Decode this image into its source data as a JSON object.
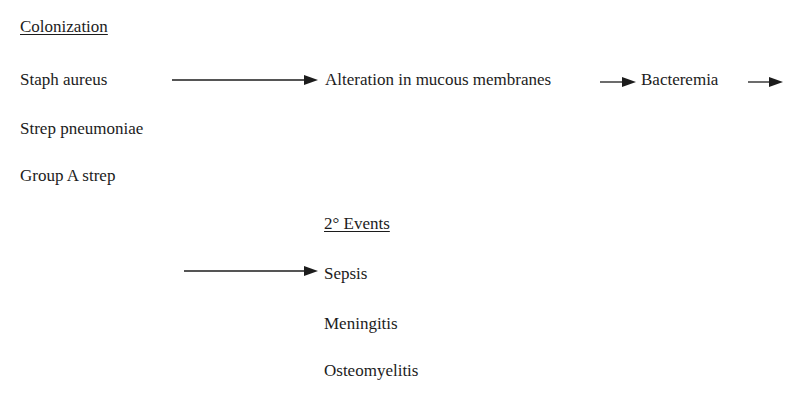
{
  "colonization": {
    "heading": "Colonization",
    "organisms": [
      "Staph aureus",
      "Strep pneumoniae",
      "Group A strep"
    ]
  },
  "flow": {
    "step1": "Alteration in mucous membranes",
    "step2": "Bacteremia"
  },
  "secondary_events": {
    "heading": "2° Events",
    "items": [
      "Sepsis",
      "Meningitis",
      "Osteomyelitis"
    ]
  },
  "colors": {
    "ink": "#1c1c1c",
    "background": "#ffffff"
  }
}
